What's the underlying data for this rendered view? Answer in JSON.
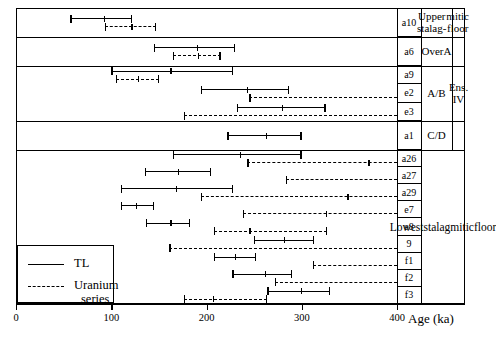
{
  "figure": {
    "axis_title": "Age (ka)",
    "legend": {
      "tl_label": "TL",
      "us_label_line1": "Uranium",
      "us_label_line2": "series"
    }
  },
  "chart_data": {
    "type": "bar",
    "title": "",
    "xlabel": "Age (ka)",
    "ylabel": "",
    "xlim": [
      0,
      400
    ],
    "xticks": [
      0,
      100,
      200,
      300,
      400
    ],
    "xticklabels": [
      "0",
      "100",
      "200",
      "300",
      "400"
    ],
    "grid": false,
    "legend_position": "bottom-left",
    "series": [
      {
        "name": "TL",
        "style": "solid"
      },
      {
        "name": "Uranium series",
        "style": "dashed"
      }
    ],
    "units": [
      {
        "label": "Upper stalag-",
        "label2": "mitic floor",
        "rows": [
          "a10"
        ]
      },
      {
        "label": "Over",
        "label2": "A",
        "rows": [
          "a6"
        ]
      },
      {
        "label": "A/B",
        "label2": "",
        "rows": [
          "a9",
          "e2",
          "e3"
        ]
      },
      {
        "label": "C/D",
        "label2": "",
        "rows": [
          "a1"
        ]
      }
    ],
    "ensembles": [
      {
        "label": "Ens. IV",
        "rows": [
          "a6",
          "a9",
          "e2",
          "e3",
          "a1"
        ]
      },
      {
        "label_line1": "Lowest",
        "label_line2": "stalagmitic",
        "label_line3": "floor",
        "rows": [
          "a26",
          "a27",
          "a29",
          "e7",
          "e8",
          "9",
          "f1",
          "f2",
          "f3"
        ]
      }
    ],
    "categories": [
      "a10",
      "a6",
      "a9",
      "e2",
      "e3",
      "a1",
      "a26",
      "a27",
      "a29",
      "e7",
      "e8",
      "9",
      "f1",
      "f2",
      "f3"
    ],
    "rows": [
      {
        "label": "a10",
        "block": 1,
        "tl": {
          "low": 57,
          "center": 92,
          "high": 122
        },
        "us": {
          "low": 93,
          "center": 121,
          "high": 147
        }
      },
      {
        "label": "a6",
        "block": 2,
        "tl": {
          "low": 145,
          "center": 190,
          "high": 230
        },
        "us": {
          "low": 165,
          "center": 191,
          "high": 215
        }
      },
      {
        "label": "a9",
        "block": 3,
        "tl": {
          "low": 100,
          "center": 162,
          "high": 228
        },
        "us": {
          "low": 105,
          "center": 128,
          "high": 150
        }
      },
      {
        "label": "e2",
        "block": 3,
        "tl": {
          "low": 194,
          "center": 242,
          "high": 287
        },
        "us": {
          "low": 245,
          "center": null,
          "high": 400,
          "off_scale_high": true
        }
      },
      {
        "label": "e3",
        "block": 3,
        "tl": {
          "low": 232,
          "center": 279,
          "high": 325
        },
        "us": {
          "low": 176,
          "center": null,
          "high": 400,
          "off_scale_high": true
        }
      },
      {
        "label": "a1",
        "block": 4,
        "tl": {
          "low": 222,
          "center": 262,
          "high": 300
        },
        "us": null
      },
      {
        "label": "a26",
        "block": 5,
        "tl": {
          "low": 165,
          "center": 235,
          "high": 300
        },
        "us": {
          "low": 243,
          "center": 370,
          "high": 400,
          "off_scale_high": true
        }
      },
      {
        "label": "a27",
        "block": 5,
        "tl": {
          "low": 135,
          "center": 170,
          "high": 205
        },
        "us": {
          "low": 283,
          "center": null,
          "high": 400,
          "off_scale_high": true
        }
      },
      {
        "label": "a29",
        "block": 5,
        "tl": {
          "low": 110,
          "center": 168,
          "high": 228
        },
        "us": {
          "low": 194,
          "center": 348,
          "high": 400,
          "off_scale_high": true
        }
      },
      {
        "label": "e7",
        "block": 5,
        "tl": {
          "low": 110,
          "center": 126,
          "high": 145
        },
        "us": {
          "low": 238,
          "center": 325,
          "high": 400,
          "off_scale_high": true
        }
      },
      {
        "label": "e8",
        "block": 5,
        "tl": {
          "low": 136,
          "center": 162,
          "high": 183
        },
        "us": {
          "low": 208,
          "center": 245,
          "high": 327
        }
      },
      {
        "label": "9",
        "block": 5,
        "tl": {
          "low": 250,
          "center": 281,
          "high": 313
        },
        "us": {
          "low": 161,
          "center": null,
          "high": 400,
          "off_scale_high": true
        }
      },
      {
        "label": "f1",
        "block": 5,
        "tl": {
          "low": 208,
          "center": 230,
          "high": 252
        },
        "us": {
          "low": 312,
          "center": null,
          "high": 400,
          "off_scale_high": true
        }
      },
      {
        "label": "f2",
        "block": 5,
        "tl": {
          "low": 227,
          "center": 261,
          "high": 290
        },
        "us": {
          "low": 272,
          "center": null,
          "high": 400,
          "off_scale_high": true
        }
      },
      {
        "label": "f3",
        "block": 5,
        "tl": {
          "low": 264,
          "center": 299,
          "high": 330
        },
        "us": {
          "low": 176,
          "center": 207,
          "high": 264
        }
      }
    ]
  }
}
